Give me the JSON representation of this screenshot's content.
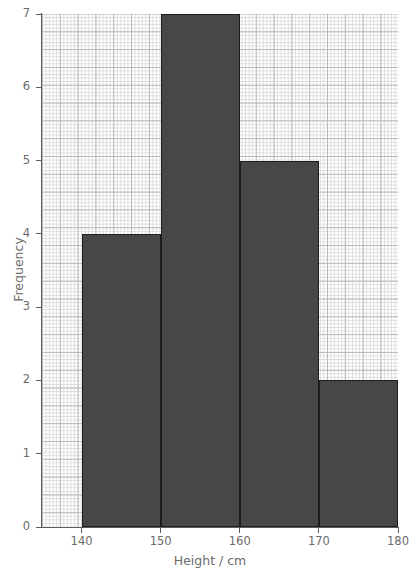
{
  "chart_data": {
    "type": "bar",
    "title": "",
    "subtitle": "",
    "xlabel": "Height / cm",
    "ylabel": "Frequency",
    "xlim": [
      135,
      180
    ],
    "ylim": [
      0,
      7
    ],
    "grid": true,
    "grid_style": "graph-paper",
    "legend": false,
    "legend_position": "none",
    "bin_edges": [
      140,
      150,
      160,
      170,
      180
    ],
    "bin_width": 10,
    "categories": [
      "140-150",
      "150-160",
      "160-170",
      "170-180"
    ],
    "values": [
      4,
      7,
      5,
      2
    ],
    "bars": [
      {
        "label": "140-150",
        "x_start": 140,
        "x_end": 150,
        "value": 4
      },
      {
        "label": "150-160",
        "x_start": 150,
        "x_end": 160,
        "value": 7
      },
      {
        "label": "160-170",
        "x_start": 160,
        "x_end": 170,
        "value": 5
      },
      {
        "label": "170-180",
        "x_start": 170,
        "x_end": 180,
        "value": 2
      }
    ],
    "x_ticks": [
      140,
      150,
      160,
      170,
      180
    ],
    "x_tick_labels": [
      "140",
      "150",
      "160",
      "170",
      "180"
    ],
    "y_ticks": [
      0,
      1,
      2,
      3,
      4,
      5,
      6,
      7
    ],
    "y_tick_labels": [
      "0",
      "1",
      "2",
      "3",
      "4",
      "5",
      "6",
      "7"
    ],
    "total_frequency": 18,
    "colors": {
      "bar_fill": "#474747",
      "bar_edge": "#1e1e1e",
      "axis": "#5d5d5d",
      "tick_label": "#6b6b6b",
      "axis_title": "#6b6b6b",
      "grid_minor": "#dcdcdc",
      "grid_major": "#b9b9b9",
      "background": "#ffffff"
    }
  }
}
